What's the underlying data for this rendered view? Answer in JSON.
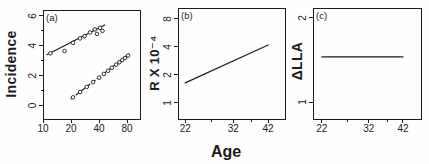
{
  "figure": {
    "shared_xlabel": "Age",
    "panel_labels": [
      "(a)",
      "(b)",
      "(c)"
    ]
  },
  "chart_data": [
    {
      "type": "scatter",
      "panel_label": "(a)",
      "ylabel": "Incidence",
      "xlabel": "",
      "x_scale": "log",
      "y_scale": "linear",
      "x_ticks": [
        10,
        20,
        40,
        80
      ],
      "x_minor_ticks": [],
      "y_ticks": [
        0,
        2,
        4,
        6
      ],
      "y_minor_ticks": [
        1,
        3,
        5
      ],
      "xlim": [
        10,
        110
      ],
      "ylim": [
        -0.9,
        6.4
      ],
      "grid": false,
      "legend": false,
      "series": [
        {
          "name": "upper-fit-line",
          "kind": "line",
          "style": "solid",
          "points": [
            [
              11,
              3.4
            ],
            [
              46,
              5.4
            ]
          ]
        },
        {
          "name": "upper-observed-points",
          "kind": "scatter",
          "points": [
            [
              12,
              3.5
            ],
            [
              17,
              3.65
            ],
            [
              21,
              4.2
            ],
            [
              25,
              4.5
            ],
            [
              28,
              4.65
            ],
            [
              32,
              4.9
            ],
            [
              36,
              5.1
            ],
            [
              38,
              4.8
            ],
            [
              41,
              5.2
            ],
            [
              43.5,
              5.0
            ]
          ]
        },
        {
          "name": "lower-fit-line",
          "kind": "line",
          "style": "dashed",
          "points": [
            [
              20,
              0.45
            ],
            [
              84,
              3.45
            ]
          ]
        },
        {
          "name": "lower-observed-points",
          "kind": "scatter",
          "points": [
            [
              21,
              0.55
            ],
            [
              25,
              0.91
            ],
            [
              29.5,
              1.25
            ],
            [
              34.5,
              1.57
            ],
            [
              40,
              1.87
            ],
            [
              45,
              2.12
            ],
            [
              50,
              2.33
            ],
            [
              55,
              2.53
            ],
            [
              61,
              2.74
            ],
            [
              66,
              2.9
            ],
            [
              71,
              3.05
            ],
            [
              76,
              3.19
            ],
            [
              82,
              3.35
            ]
          ]
        }
      ]
    },
    {
      "type": "line",
      "panel_label": "(b)",
      "ylabel": "R X 10⁻⁴",
      "xlabel": "Age",
      "x_scale": "log",
      "y_scale": "log",
      "x_ticks": [
        22,
        32,
        42
      ],
      "x_minor_ticks": [
        27,
        37
      ],
      "y_ticks": [
        1,
        2,
        4,
        8
      ],
      "y_minor_ticks": [],
      "xlim": [
        20.8,
        47.9
      ],
      "ylim": [
        0.67,
        10.5
      ],
      "grid": false,
      "legend": false,
      "series": [
        {
          "name": "relative-risk-line",
          "kind": "line",
          "style": "solid",
          "points": [
            [
              22,
              1.64
            ],
            [
              42,
              4.2
            ]
          ]
        }
      ]
    },
    {
      "type": "line",
      "panel_label": "(c)",
      "ylabel": "ΔLLA",
      "xlabel": "",
      "x_scale": "log",
      "y_scale": "log",
      "x_ticks": [
        22,
        32,
        42
      ],
      "x_minor_ticks": [
        27,
        37
      ],
      "y_ticks": [
        1,
        2
      ],
      "y_minor_ticks": [],
      "xlim": [
        20.5,
        48.5
      ],
      "ylim": [
        0.87,
        2.17
      ],
      "grid": false,
      "legend": false,
      "series": [
        {
          "name": "delta-lla-line",
          "kind": "line",
          "style": "solid",
          "points": [
            [
              22,
              1.45
            ],
            [
              42,
              1.45
            ]
          ]
        }
      ]
    }
  ]
}
